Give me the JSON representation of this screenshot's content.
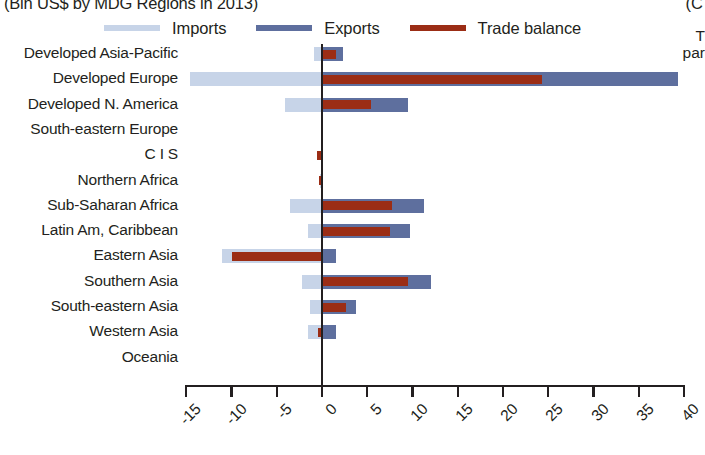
{
  "title": {
    "main": "(Bln US$ by MDG Regions in 2013)",
    "right_fragment": "(C"
  },
  "legend": {
    "position": "top",
    "items": [
      {
        "label": "Imports",
        "color": "#c7d4e8",
        "icon": "line-swatch"
      },
      {
        "label": "Exports",
        "color": "#5e6f9e",
        "icon": "line-swatch"
      },
      {
        "label": "Trade balance",
        "color": "#9b2d15",
        "icon": "line-swatch"
      }
    ]
  },
  "annotation_fragment": {
    "line1": "T",
    "line2": "par"
  },
  "chart_data": {
    "type": "bar",
    "orientation": "horizontal",
    "title": "(Bln US$ by MDG Regions in 2013)",
    "xlabel": "",
    "ylabel": "",
    "xlim": [
      -15,
      40
    ],
    "xticks": [
      -15,
      -10,
      -5,
      0,
      5,
      10,
      15,
      20,
      25,
      30,
      35,
      40
    ],
    "xtick_labels": [
      "-15",
      "-10",
      "-5",
      "0",
      "5",
      "10",
      "15",
      "20",
      "25",
      "30",
      "35",
      "40"
    ],
    "grid": false,
    "legend_position": "top",
    "zero_line": true,
    "categories": [
      "Developed Asia-Pacific",
      "Developed Europe",
      "Developed N. America",
      "South-eastern Europe",
      "C I S",
      "Northern Africa",
      "Sub-Saharan Africa",
      "Latin Am, Caribbean",
      "Eastern Asia",
      "Southern Asia",
      "South-eastern Asia",
      "Western Asia",
      "Oceania"
    ],
    "series": [
      {
        "name": "Imports",
        "color": "#c7d4e8",
        "values": [
          -0.9,
          -14.6,
          -4.1,
          0,
          -0.1,
          -0.2,
          -3.5,
          -1.5,
          -11.0,
          -2.2,
          -1.3,
          -1.5,
          0
        ]
      },
      {
        "name": "Exports",
        "color": "#5e6f9e",
        "values": [
          2.3,
          39.3,
          9.5,
          0,
          0,
          0,
          11.3,
          9.7,
          1.5,
          12.0,
          3.8,
          1.5,
          0
        ]
      },
      {
        "name": "Trade balance",
        "color": "#9b2d15",
        "values": [
          1.6,
          24.3,
          5.4,
          0,
          -0.5,
          -0.3,
          7.7,
          7.5,
          -9.9,
          9.5,
          2.7,
          -0.4,
          -0.1
        ]
      }
    ]
  }
}
